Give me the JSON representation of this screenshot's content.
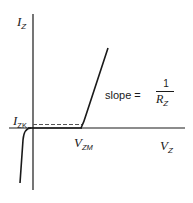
{
  "diagram": {
    "type": "zener-diode-iv-characteristic",
    "y_axis": {
      "symbol": "I",
      "subscript": "Z"
    },
    "x_axis": {
      "symbol": "V",
      "subscript": "Z"
    },
    "knee_current": {
      "symbol": "I",
      "subscript": "ZK"
    },
    "breakdown_voltage": {
      "symbol": "V",
      "subscript": "ZM"
    },
    "slope_annotation": {
      "prefix": "slope =",
      "numerator": "1",
      "denominator_symbol": "R",
      "denominator_subscript": "Z"
    },
    "colors": {
      "line": "#1a1a1a",
      "dashed": "#555555",
      "background": "#ffffff"
    }
  }
}
